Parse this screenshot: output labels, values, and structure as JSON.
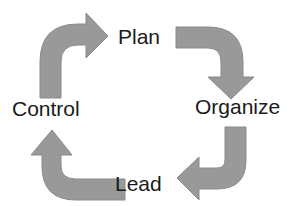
{
  "diagram": {
    "type": "cycle",
    "title": "",
    "arrow_color": "#999999",
    "text_color": "#1a1a1a",
    "stages": [
      {
        "label": "Plan",
        "position": "top"
      },
      {
        "label": "Organize",
        "position": "right"
      },
      {
        "label": "Lead",
        "position": "bottom"
      },
      {
        "label": "Control",
        "position": "left"
      }
    ],
    "arrows": [
      {
        "from": "Control",
        "to": "Plan",
        "direction": "up-then-right"
      },
      {
        "from": "Plan",
        "to": "Organize",
        "direction": "right-then-down"
      },
      {
        "from": "Organize",
        "to": "Lead",
        "direction": "down-then-left"
      },
      {
        "from": "Lead",
        "to": "Control",
        "direction": "left-then-up"
      }
    ]
  }
}
